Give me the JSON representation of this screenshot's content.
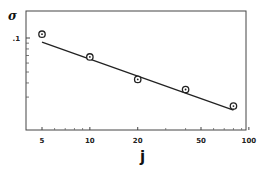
{
  "chart_data": {
    "type": "scatter",
    "title": "",
    "xlabel": "j",
    "ylabel": "σ",
    "xscale": "log",
    "yscale": "log",
    "xlim": [
      4.2,
      105
    ],
    "ylim": [
      0.019,
      0.125
    ],
    "grid": false,
    "legend": null,
    "x_ticks": [
      5,
      10,
      20,
      50,
      100
    ],
    "x_tick_labels": [
      "5",
      "10",
      "20",
      "50",
      "100"
    ],
    "x_minor_ticks": [
      6,
      7,
      8,
      9,
      30,
      40,
      60,
      70,
      80,
      90
    ],
    "y_ticks": [
      0.1
    ],
    "y_tick_labels": [
      ".1"
    ],
    "y_minor_ticks": [
      0.09,
      0.08,
      0.07,
      0.06,
      0.05,
      0.04,
      0.03
    ],
    "series": [
      {
        "name": "data",
        "marker": "circle-dot",
        "x": [
          5,
          10,
          20,
          40,
          80
        ],
        "y": [
          0.108,
          0.068,
          0.043,
          0.035,
          0.025
        ]
      },
      {
        "name": "fit",
        "style": "line",
        "x": [
          5,
          80
        ],
        "y": [
          0.092,
          0.023
        ]
      }
    ]
  }
}
